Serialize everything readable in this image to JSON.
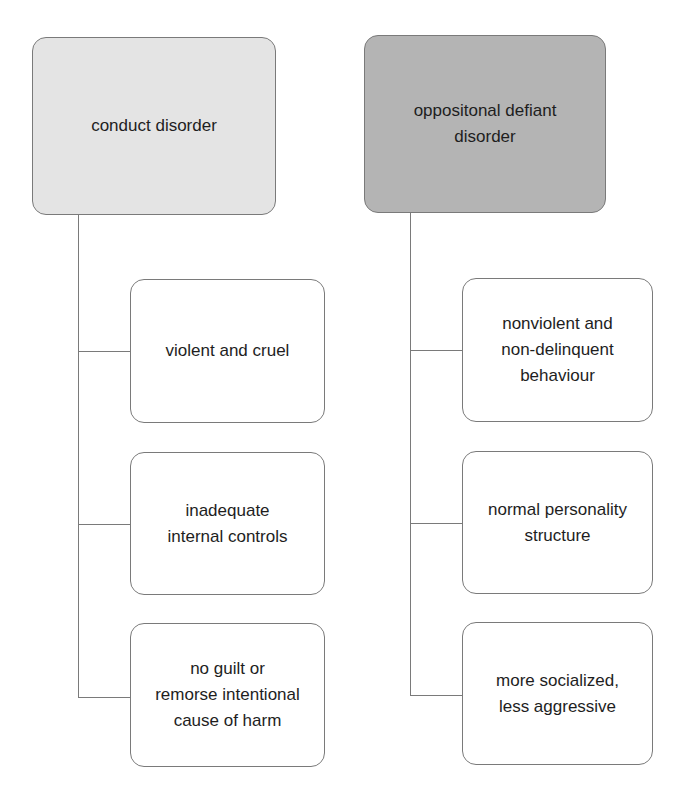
{
  "diagram": {
    "type": "comparison-tree",
    "columns": [
      {
        "header": "conduct disorder",
        "header_fill": "#e4e4e4",
        "items": [
          "violent and cruel",
          "inadequate\ninternal controls",
          "no guilt or\nremorse intentional\ncause of harm"
        ]
      },
      {
        "header": "oppositonal defiant\ndisorder",
        "header_fill": "#b4b4b4",
        "items": [
          "nonviolent and\nnon-delinquent\nbehaviour",
          "normal personality\nstructure",
          "more socialized,\nless aggressive"
        ]
      }
    ]
  }
}
